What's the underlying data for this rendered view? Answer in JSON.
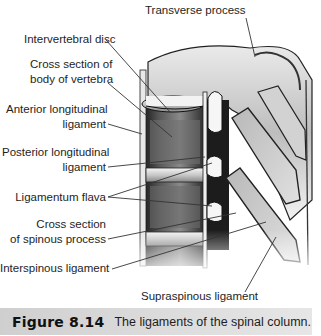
{
  "figure": {
    "labels": {
      "transverse_process": "Transverse process",
      "intervertebral_disc": "Intervertebral disc",
      "cross_section_body_line1": "Cross section of",
      "cross_section_body_line2": "body of vertebra",
      "anterior_longitudinal_line1": "Anterior longitudinal",
      "anterior_longitudinal_line2": "ligament",
      "posterior_longitudinal_line1": "Posterior longitudinal",
      "posterior_longitudinal_line2": "ligament",
      "ligamentum_flava": "Ligamentum flava",
      "cross_section_spinous_line1": "Cross section",
      "cross_section_spinous_line2": "of spinous process",
      "interspinous_ligament": "Interspinous ligament",
      "supraspinous_ligament": "Supraspinous ligament"
    }
  },
  "caption": {
    "number": "Figure 8.14",
    "text": "The ligaments of the spinal column."
  },
  "colors": {
    "caption_bg": "#d9d9d9",
    "leader_line": "#333333"
  }
}
